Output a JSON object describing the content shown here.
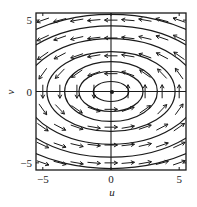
{
  "chart_data": {
    "type": "quiver",
    "title": "",
    "xlabel": "u",
    "ylabel": "v",
    "xlim": [
      -5.5,
      5.5
    ],
    "ylim": [
      -5.5,
      5.5
    ],
    "xticks": [
      -5,
      0,
      5
    ],
    "yticks": [
      -5,
      0,
      5
    ],
    "xtick_labels": [
      "−5",
      "0",
      "5"
    ],
    "ytick_labels": [
      "−5",
      "0",
      "5"
    ],
    "grid": false,
    "legend": null,
    "vector_field": {
      "description": "Counterclockwise rotation about a center at the origin",
      "du": "-3*v",
      "dv": "u",
      "grid_u": [
        -5,
        -3.75,
        -2.5,
        -1.25,
        0,
        1.25,
        2.5,
        3.75,
        5
      ],
      "grid_v": [
        -5,
        -3.75,
        -2.5,
        -1.25,
        0,
        1.25,
        2.5,
        3.75,
        5
      ],
      "arrow_length_units": 0.95,
      "normalized": true
    },
    "trajectories": {
      "type": "ellipse",
      "center": [
        0,
        0
      ],
      "semi_axes": [
        {
          "u": 1.3,
          "v": 0.7
        },
        {
          "u": 2.35,
          "v": 1.4
        },
        {
          "u": 3.4,
          "v": 2.1
        },
        {
          "u": 4.7,
          "v": 2.8
        },
        {
          "u": 6.3,
          "v": 3.7
        },
        {
          "u": 7.8,
          "v": 4.6
        },
        {
          "u": 9.3,
          "v": 5.4
        }
      ]
    },
    "axes_through_origin": true,
    "equilibrium_point": [
      0,
      0
    ]
  },
  "colors": {
    "line": "#1a1a1a",
    "background": "#ffffff"
  }
}
